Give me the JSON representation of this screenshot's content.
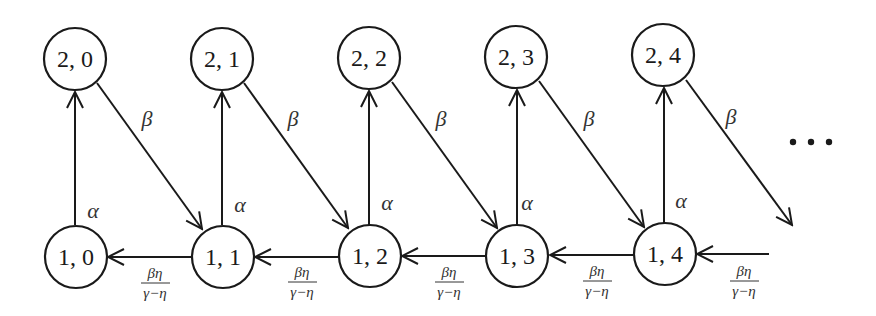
{
  "diagram": {
    "type": "state-transition",
    "stroke_color": "#1a1a1a",
    "label_color": "#333333",
    "nodes": {
      "n20": {
        "label": "2, 0"
      },
      "n21": {
        "label": "2, 1"
      },
      "n22": {
        "label": "2, 2"
      },
      "n23": {
        "label": "2, 3"
      },
      "n24": {
        "label": "2, 4"
      },
      "n10": {
        "label": "1, 0"
      },
      "n11": {
        "label": "1, 1"
      },
      "n12": {
        "label": "1, 2"
      },
      "n13": {
        "label": "1, 3"
      },
      "n14": {
        "label": "1, 4"
      }
    },
    "edge_labels": {
      "alpha": "α",
      "beta": "β",
      "frac_num": "βη",
      "frac_den": "γ−η"
    },
    "edges": [
      {
        "from": "1, 0",
        "to": "2, 0",
        "label": "α"
      },
      {
        "from": "1, 1",
        "to": "2, 1",
        "label": "α"
      },
      {
        "from": "1, 2",
        "to": "2, 2",
        "label": "α"
      },
      {
        "from": "1, 3",
        "to": "2, 3",
        "label": "α"
      },
      {
        "from": "1, 4",
        "to": "2, 4",
        "label": "α"
      },
      {
        "from": "2, 0",
        "to": "1, 1",
        "label": "β"
      },
      {
        "from": "2, 1",
        "to": "1, 2",
        "label": "β"
      },
      {
        "from": "2, 2",
        "to": "1, 3",
        "label": "β"
      },
      {
        "from": "2, 3",
        "to": "1, 4",
        "label": "β"
      },
      {
        "from": "2, 4",
        "to": "…",
        "label": "β"
      },
      {
        "from": "1, 1",
        "to": "1, 0",
        "label": "βη/(γ−η)"
      },
      {
        "from": "1, 2",
        "to": "1, 1",
        "label": "βη/(γ−η)"
      },
      {
        "from": "1, 3",
        "to": "1, 2",
        "label": "βη/(γ−η)"
      },
      {
        "from": "1, 4",
        "to": "1, 3",
        "label": "βη/(γ−η)"
      },
      {
        "from": "…",
        "to": "1, 4",
        "label": "βη/(γ−η)"
      }
    ],
    "continuation": "…"
  }
}
